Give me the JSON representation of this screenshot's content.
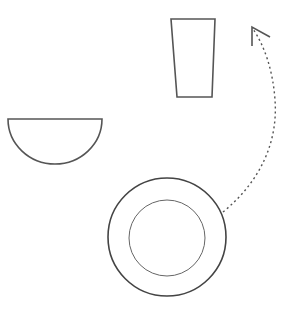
{
  "diagram": {
    "stroke_color": "#555555",
    "background": "#ffffff",
    "items": [
      {
        "name": "cup",
        "shape": "trapezoid"
      },
      {
        "name": "bowl",
        "shape": "half-circle"
      },
      {
        "name": "plate",
        "shape": "concentric-circles"
      }
    ],
    "arrow": {
      "style": "dashed",
      "from": "plate",
      "to": "cup"
    }
  }
}
